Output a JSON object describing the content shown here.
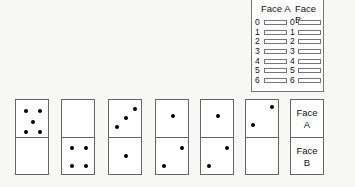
{
  "tally_table": {
    "headers": [
      "Face A",
      "Face B"
    ],
    "rows": [
      "0",
      "1",
      "2",
      "3",
      "4",
      "5",
      "6"
    ]
  },
  "dominoes": [
    {
      "face_a": 5,
      "face_b": 0
    },
    {
      "face_a": 0,
      "face_b": 4
    },
    {
      "face_a": 3,
      "face_b": 1
    },
    {
      "face_a": 1,
      "face_b": 2
    },
    {
      "face_a": 1,
      "face_b": 2
    },
    {
      "face_a": 2,
      "face_b": 0
    }
  ],
  "legend_domino": {
    "face_a_line1": "Face",
    "face_a_line2": "A",
    "face_b_line1": "Face",
    "face_b_line2": "B"
  }
}
